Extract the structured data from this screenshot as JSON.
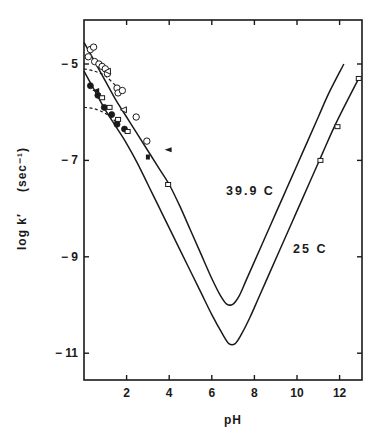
{
  "chart_data": {
    "type": "line",
    "title": "",
    "xlabel": "pH",
    "ylabel": "log k′   (sec⁻¹)",
    "xlim": [
      0,
      13
    ],
    "ylim": [
      -12.2,
      -4.1
    ],
    "xticks": [
      2,
      4,
      6,
      8,
      10,
      12
    ],
    "xtick_labels": [
      "2",
      "4",
      "6",
      "8",
      "10",
      "12"
    ],
    "yticks": [
      -5,
      -7,
      -9,
      -11
    ],
    "ytick_labels": [
      "-5",
      "-7",
      "-9",
      "-11"
    ],
    "grid": false,
    "legend": null,
    "annotations": [
      {
        "text": "39.9  C",
        "x": 6.6,
        "y": -7.65
      },
      {
        "text": "25  C",
        "x": 9.8,
        "y": -8.9
      }
    ],
    "series": [
      {
        "name": "39.9 C",
        "style": "solid",
        "x": [
          0.0,
          0.5,
          1.0,
          1.5,
          2.0,
          2.5,
          3.0,
          3.5,
          4.0,
          4.5,
          5.0,
          5.5,
          6.0,
          6.4,
          6.7,
          7.0,
          7.3,
          7.6,
          8.0,
          8.5,
          9.0,
          9.5,
          10.0,
          10.5,
          11.0,
          11.5,
          12.2
        ],
        "y": [
          -4.55,
          -4.95,
          -5.35,
          -5.75,
          -6.1,
          -6.45,
          -6.8,
          -7.15,
          -7.5,
          -7.95,
          -8.45,
          -8.95,
          -9.45,
          -9.8,
          -9.98,
          -9.98,
          -9.8,
          -9.5,
          -9.1,
          -8.6,
          -8.1,
          -7.6,
          -7.1,
          -6.6,
          -6.1,
          -5.6,
          -5.0
        ]
      },
      {
        "name": "25 C",
        "style": "solid",
        "x": [
          0.0,
          0.5,
          1.0,
          1.5,
          2.0,
          2.5,
          3.0,
          3.5,
          4.0,
          4.5,
          5.0,
          5.5,
          6.0,
          6.5,
          6.8,
          7.1,
          7.4,
          7.8,
          8.2,
          8.7,
          9.2,
          9.7,
          10.2,
          10.7,
          11.2,
          11.7,
          12.2,
          12.9
        ],
        "y": [
          -5.15,
          -5.55,
          -5.95,
          -6.3,
          -6.65,
          -7.05,
          -7.5,
          -7.95,
          -8.4,
          -8.85,
          -9.3,
          -9.75,
          -10.2,
          -10.6,
          -10.8,
          -10.8,
          -10.6,
          -10.25,
          -9.85,
          -9.35,
          -8.85,
          -8.35,
          -7.85,
          -7.35,
          -6.85,
          -6.35,
          -5.9,
          -5.3
        ]
      },
      {
        "name": "dashed upper",
        "style": "dashed",
        "x": [
          0.0,
          0.5,
          1.0,
          1.5,
          1.8
        ],
        "y": [
          -5.1,
          -5.15,
          -5.25,
          -5.45,
          -5.55
        ]
      },
      {
        "name": "dashed lower",
        "style": "dashed",
        "x": [
          0.0,
          0.4,
          0.8,
          1.2,
          1.6
        ],
        "y": [
          -5.9,
          -5.92,
          -5.98,
          -6.08,
          -6.25
        ]
      }
    ],
    "points": {
      "open_circle": [
        {
          "x": 0.3,
          "y": -4.7
        },
        {
          "x": 0.2,
          "y": -4.85
        },
        {
          "x": 0.45,
          "y": -4.65
        },
        {
          "x": 0.5,
          "y": -4.95
        },
        {
          "x": 0.7,
          "y": -5.0
        },
        {
          "x": 0.85,
          "y": -5.05
        },
        {
          "x": 1.0,
          "y": -5.1
        },
        {
          "x": 1.1,
          "y": -5.2
        },
        {
          "x": 1.55,
          "y": -5.5
        },
        {
          "x": 1.6,
          "y": -5.6
        },
        {
          "x": 2.45,
          "y": -6.1
        },
        {
          "x": 2.95,
          "y": -6.6
        },
        {
          "x": 1.8,
          "y": -5.55
        }
      ],
      "filled_circle": [
        {
          "x": 0.3,
          "y": -5.45
        },
        {
          "x": 0.65,
          "y": -5.65
        },
        {
          "x": 0.95,
          "y": -5.9
        },
        {
          "x": 1.3,
          "y": -6.05
        },
        {
          "x": 1.55,
          "y": -6.25
        },
        {
          "x": 1.9,
          "y": -6.35
        }
      ],
      "open_square": [
        {
          "x": 0.85,
          "y": -5.7
        },
        {
          "x": 1.2,
          "y": -5.9
        },
        {
          "x": 1.6,
          "y": -6.15
        },
        {
          "x": 2.05,
          "y": -6.4
        },
        {
          "x": 3.95,
          "y": -7.5
        },
        {
          "x": 11.1,
          "y": -7.0
        },
        {
          "x": 11.9,
          "y": -6.3
        },
        {
          "x": 12.9,
          "y": -5.3
        }
      ],
      "filled_square": [
        {
          "x": 3.0,
          "y": -6.93
        }
      ],
      "open_triangle": [
        {
          "x": 1.85,
          "y": -5.95
        },
        {
          "x": 1.1,
          "y": -5.15
        }
      ],
      "filled_triangle": [
        {
          "x": 3.95,
          "y": -6.78
        },
        {
          "x": 0.55,
          "y": -5.55
        }
      ]
    }
  },
  "labels": {
    "x_axis_title": "pH",
    "y_axis_title_main": "log k′",
    "y_axis_title_unit": "(sec⁻¹)",
    "curve_upper": "39.9  C",
    "curve_lower": "25  C"
  },
  "colors": {
    "ink": "#1a1a1a",
    "background": "#ffffff"
  }
}
